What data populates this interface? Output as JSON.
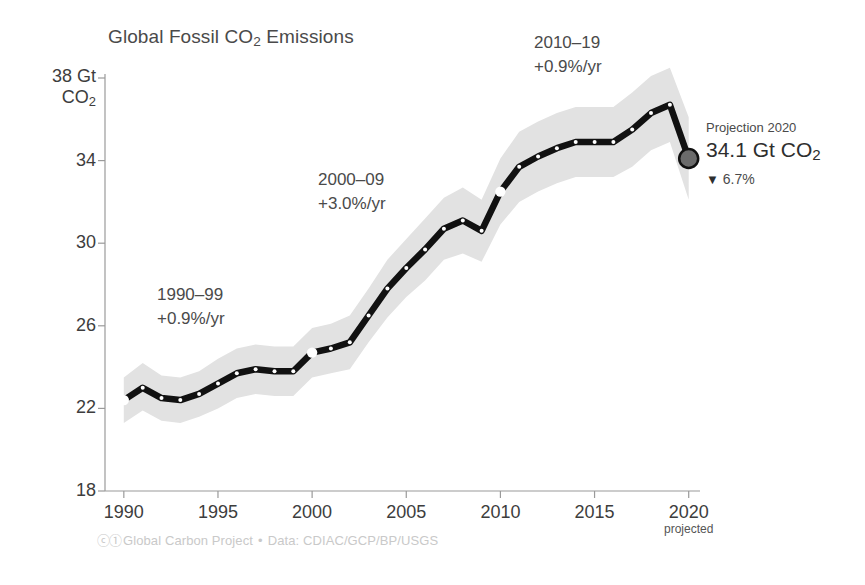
{
  "chart_data": {
    "type": "line",
    "title": "Global Fossil CO2 Emissions",
    "title_parts": {
      "pre": "Global Fossil CO",
      "sub": "2",
      "post": " Emissions"
    },
    "xlabel": "",
    "ylabel": "Gt CO2",
    "ylabel_parts": {
      "top": "38 Gt",
      "bottom_pre": "CO",
      "bottom_sub": "2"
    },
    "grid": false,
    "legend": "none",
    "xlim": [
      1989,
      2020.6
    ],
    "ylim": [
      18,
      38.6
    ],
    "x_ticks": [
      1990,
      1995,
      2000,
      2005,
      2010,
      2015,
      2020
    ],
    "x_tick_labels": [
      "1990",
      "1995",
      "2000",
      "2005",
      "2010",
      "2015",
      "2020"
    ],
    "x_tick_sublabel": {
      "at": 2020,
      "text": "projected"
    },
    "y_ticks": [
      18,
      22,
      26,
      30,
      34,
      38
    ],
    "y_tick_labels": [
      "18",
      "22",
      "26",
      "30",
      "34",
      "38"
    ],
    "x": [
      1990,
      1991,
      1992,
      1993,
      1994,
      1995,
      1996,
      1997,
      1998,
      1999,
      2000,
      2001,
      2002,
      2003,
      2004,
      2005,
      2006,
      2007,
      2008,
      2009,
      2010,
      2011,
      2012,
      2013,
      2014,
      2015,
      2016,
      2017,
      2018,
      2019,
      2020
    ],
    "series": [
      {
        "name": "Global fossil CO2 emissions",
        "values": [
          22.4,
          23.0,
          22.5,
          22.4,
          22.7,
          23.2,
          23.7,
          23.9,
          23.8,
          23.8,
          24.7,
          24.9,
          25.2,
          26.5,
          27.8,
          28.8,
          29.7,
          30.7,
          31.1,
          30.6,
          32.5,
          33.7,
          34.2,
          34.6,
          34.9,
          34.9,
          34.9,
          35.5,
          36.3,
          36.7,
          34.1
        ]
      }
    ],
    "uncertainty_band": {
      "label": "uncertainty",
      "lower": [
        21.3,
        21.9,
        21.4,
        21.3,
        21.6,
        22.0,
        22.5,
        22.7,
        22.6,
        22.6,
        23.5,
        23.7,
        23.9,
        25.2,
        26.4,
        27.4,
        28.2,
        29.2,
        29.5,
        29.1,
        30.9,
        32.0,
        32.5,
        32.9,
        33.2,
        33.2,
        33.2,
        33.7,
        34.5,
        34.9,
        32.1
      ],
      "upper": [
        23.5,
        24.2,
        23.6,
        23.5,
        23.8,
        24.4,
        24.9,
        25.1,
        25.0,
        25.0,
        25.9,
        26.1,
        26.5,
        27.8,
        29.2,
        30.2,
        31.2,
        32.2,
        32.7,
        32.1,
        34.1,
        35.4,
        35.9,
        36.3,
        36.6,
        36.6,
        36.6,
        37.3,
        38.1,
        38.5,
        36.1
      ]
    },
    "highlight_points": [
      {
        "x": 1990,
        "y": 22.4
      },
      {
        "x": 2000,
        "y": 24.7
      },
      {
        "x": 2010,
        "y": 32.5
      }
    ],
    "end_point": {
      "x": 2020,
      "y": 34.1
    },
    "annotations": [
      {
        "id": "decade-1990s",
        "line1": "1990–99",
        "line2": "+0.9%/yr",
        "x_px": 157,
        "y_px": 283
      },
      {
        "id": "decade-2000s",
        "line1": "2000–09",
        "line2": "+3.0%/yr",
        "x_px": 318,
        "y_px": 168
      },
      {
        "id": "decade-2010s",
        "line1": "2010–19",
        "line2": "+0.9%/yr",
        "x_px": 534,
        "y_px": 31
      }
    ],
    "colors": {
      "line": "#111111",
      "band": "#e2e2e2",
      "axis": "#9a9a9a",
      "text": "#3d3d3d",
      "marker_fill": "#ffffff",
      "endpoint_fill": "#6b6b6b",
      "credit": "#c9c9c9"
    }
  },
  "projection": {
    "title": "Projection 2020",
    "value_pre": "34.1 Gt CO",
    "value_sub": "2",
    "triangle": "▼",
    "delta": "6.7%"
  },
  "credit": {
    "cc_icons": "ⓒ①",
    "org": "Global Carbon Project",
    "separator": "•",
    "data_source": "Data: CDIAC/GCP/BP/USGS"
  }
}
